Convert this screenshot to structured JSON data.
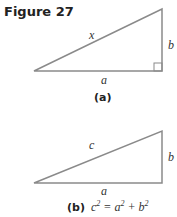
{
  "figure": {
    "title": "Figure 27",
    "a": {
      "hypotenuse_label": "x",
      "base_label": "a",
      "height_label": "b",
      "caption": "(a)",
      "right_angle_marker": true
    },
    "b": {
      "hypotenuse_label": "c",
      "base_label": "a",
      "height_label": "b",
      "caption": "(b)",
      "equation": {
        "lhs": "c",
        "exp": "2",
        "eq": " = ",
        "t1": "a",
        "plus": " + ",
        "t2": "b"
      }
    },
    "line_color": "#888888"
  }
}
